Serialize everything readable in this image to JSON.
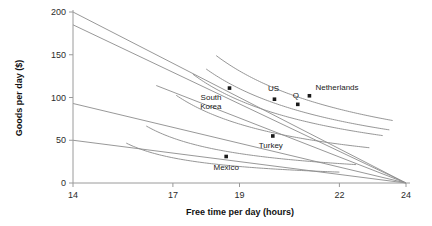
{
  "chart_data": {
    "type": "scatter",
    "title": "",
    "xlabel": "Free time per day (hours)",
    "ylabel": "Goods per day ($)",
    "xlim": [
      14,
      24
    ],
    "ylim": [
      0,
      200
    ],
    "xticks": [
      14,
      17,
      19,
      22,
      24
    ],
    "yticks": [
      0,
      50,
      100,
      150,
      200
    ],
    "xtick_labels": [
      "14",
      "17",
      "19",
      "22",
      "24"
    ],
    "ytick_labels": [
      "0",
      "50",
      "100",
      "150",
      "200"
    ],
    "grid": false,
    "legend": "none",
    "annotations": [
      {
        "label": "Netherlands",
        "x": 21.1,
        "y": 102,
        "label_dx": 6,
        "label_dy": -6,
        "anchor": "start"
      },
      {
        "label": "US",
        "x": 20.05,
        "y": 98,
        "label_dx": -1,
        "label_dy": -8,
        "anchor": "middle"
      },
      {
        "label": "Q",
        "x": 20.75,
        "y": 92,
        "label_dx": -2,
        "label_dy": -6,
        "anchor": "middle"
      },
      {
        "label": "South Korea",
        "x": 18.7,
        "y": 111,
        "label_dx": -8,
        "label_dy": 12,
        "anchor": "end"
      },
      {
        "label": "Turkey",
        "x": 20.0,
        "y": 55,
        "label_dx": -2,
        "label_dy": 12,
        "anchor": "middle"
      },
      {
        "label": "Mexico",
        "x": 18.6,
        "y": 31,
        "label_dx": 0,
        "label_dy": 14,
        "anchor": "middle"
      }
    ],
    "budget_lines": [
      {
        "name": "netherlands-budget",
        "x0": 14.0,
        "y0": 200,
        "x1": 24,
        "y1": 0
      },
      {
        "name": "us-budget",
        "x0": 14.0,
        "y0": 185,
        "x1": 24,
        "y1": 0
      },
      {
        "name": "south-korea-budget",
        "x0": 14.0,
        "y0": 93,
        "x1": 24,
        "y1": 0
      },
      {
        "name": "mexico-budget",
        "x0": 14.0,
        "y0": 50,
        "x1": 24,
        "y1": 0
      },
      {
        "name": "turkey-budget",
        "x0": 16.5,
        "y0": 114,
        "x1": 24,
        "y1": 0
      }
    ],
    "indifference_curves": [
      {
        "name": "netherlands-curve",
        "k": 760,
        "x_min": 18.3,
        "x_max": 23.6
      },
      {
        "name": "us-curve",
        "k": 560,
        "x_min": 17.6,
        "x_max": 23.3
      },
      {
        "name": "q-curve",
        "k": 640,
        "x_min": 18.0,
        "x_max": 23.5
      },
      {
        "name": "south-korea-curve",
        "k": 400,
        "x_min": 17.1,
        "x_max": 22.9
      },
      {
        "name": "turkey-curve",
        "k": 200,
        "x_min": 16.2,
        "x_max": 22.5
      },
      {
        "name": "mexico-curve",
        "k": 112,
        "x_min": 15.6,
        "x_max": 22.0
      }
    ],
    "points": [
      {
        "name": "netherlands-point",
        "x": 21.1,
        "y": 102
      },
      {
        "name": "us-point",
        "x": 20.05,
        "y": 98
      },
      {
        "name": "q-point",
        "x": 20.75,
        "y": 92
      },
      {
        "name": "south-korea-point",
        "x": 18.7,
        "y": 111
      },
      {
        "name": "turkey-point",
        "x": 20.0,
        "y": 55
      },
      {
        "name": "mexico-point",
        "x": 18.6,
        "y": 31
      }
    ]
  }
}
